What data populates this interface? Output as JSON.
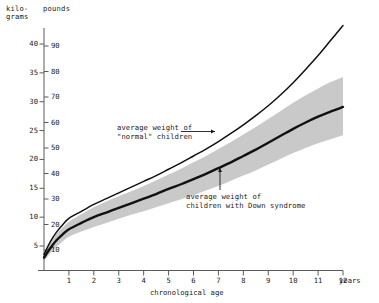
{
  "figure": {
    "left_axis_header": "kilo-\ngrams",
    "right_axis_header": "pounds",
    "x_axis_title": "chronological age",
    "x_unit_label": "years"
  },
  "annotations": {
    "normal": "average weight of\n\"normal\" children",
    "down": "average weight of\nchildren with Down syndrome"
  },
  "colors": {
    "curve": "#111111",
    "band": "#c9c9c9",
    "axis": "#5a5a5a",
    "text": "#1a1a1a"
  },
  "chart_data": {
    "type": "line",
    "title": "",
    "subtitle": "",
    "xlabel": "chronological age",
    "ylabel": "kilograms",
    "y2label": "pounds",
    "xlim": [
      0,
      12
    ],
    "ylim": [
      0,
      43
    ],
    "y2lim": [
      0,
      95
    ],
    "grid": false,
    "legend": "none",
    "x_unit": "years",
    "xticks": [
      1,
      2,
      3,
      4,
      5,
      6,
      7,
      8,
      9,
      10,
      11,
      12
    ],
    "xticklabels": [
      "1",
      "2",
      "3",
      "4",
      "5",
      "6",
      "7",
      "8",
      "9",
      "10",
      "11",
      "12"
    ],
    "yticks_kilograms": [
      5,
      10,
      15,
      20,
      25,
      30,
      35,
      40
    ],
    "yticklabels_kilograms": [
      "5",
      "10",
      "15",
      "20",
      "25",
      "30",
      "35",
      "40"
    ],
    "yticks_pounds": [
      10,
      20,
      30,
      40,
      50,
      60,
      70,
      80,
      90
    ],
    "yticklabels_pounds": [
      "10",
      "20",
      "30",
      "40",
      "50",
      "60",
      "70",
      "80",
      "90"
    ],
    "x": [
      0,
      0.25,
      0.5,
      0.75,
      1,
      1.5,
      2,
      2.5,
      3,
      3.5,
      4,
      4.5,
      5,
      5.5,
      6,
      6.5,
      7,
      7.5,
      8,
      8.5,
      9,
      9.5,
      10,
      10.5,
      11,
      11.5,
      12
    ],
    "series": [
      {
        "name": "average weight of \"normal\" children",
        "unit": "kilograms",
        "values": [
          3.5,
          5.7,
          7.4,
          8.7,
          9.8,
          11.0,
          12.2,
          13.2,
          14.2,
          15.2,
          16.2,
          17.2,
          18.3,
          19.4,
          20.6,
          21.8,
          23.1,
          24.5,
          26.0,
          27.6,
          29.3,
          31.2,
          33.3,
          35.6,
          38.0,
          40.6,
          43.2
        ]
      },
      {
        "name": "average weight of children with Down syndrome",
        "unit": "kilograms",
        "values": [
          3.0,
          4.6,
          6.0,
          7.0,
          7.9,
          9.0,
          10.0,
          10.8,
          11.6,
          12.4,
          13.2,
          14.0,
          14.9,
          15.7,
          16.6,
          17.5,
          18.5,
          19.5,
          20.6,
          21.7,
          22.9,
          24.1,
          25.3,
          26.4,
          27.4,
          28.3,
          29.1
        ],
        "band": {
          "description": "shaded range around average weight of children with Down syndrome",
          "lower": [
            2.4,
            3.7,
            4.9,
            5.8,
            6.6,
            7.5,
            8.3,
            9.0,
            9.7,
            10.4,
            11.0,
            11.7,
            12.4,
            13.1,
            13.8,
            14.6,
            15.4,
            16.3,
            17.2,
            18.1,
            19.1,
            20.1,
            21.1,
            22.0,
            22.8,
            23.5,
            24.2
          ],
          "upper": [
            3.7,
            5.5,
            7.1,
            8.2,
            9.2,
            10.5,
            11.7,
            12.7,
            13.6,
            14.5,
            15.4,
            16.4,
            17.4,
            18.4,
            19.5,
            20.6,
            21.8,
            23.0,
            24.3,
            25.6,
            27.0,
            28.4,
            29.8,
            31.1,
            32.3,
            33.4,
            34.3
          ]
        }
      }
    ]
  }
}
